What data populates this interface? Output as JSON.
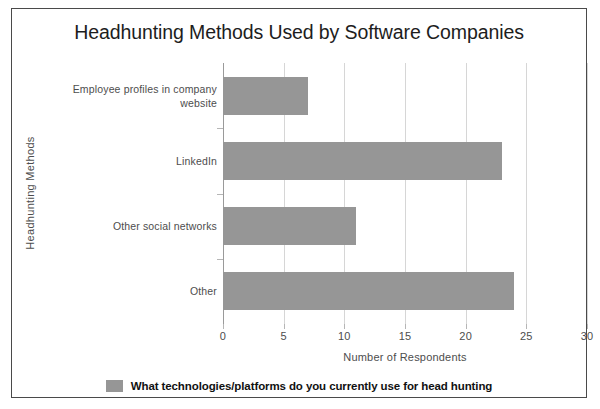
{
  "chart_data": {
    "type": "bar",
    "orientation": "horizontal",
    "title": "Headhunting Methods Used by Software Companies",
    "xlabel": "Number of Respondents",
    "ylabel": "Headhunting Methods",
    "categories": [
      "Employee profiles in company website",
      "LinkedIn",
      "Other social networks",
      "Other"
    ],
    "category_lines": [
      [
        "Employee profiles in company",
        "website"
      ],
      [
        "LinkedIn"
      ],
      [
        "Other social networks"
      ],
      [
        "Other"
      ]
    ],
    "values": [
      7,
      23,
      11,
      24
    ],
    "series": [
      {
        "name": "What technologies/platforms do you currently use for head hunting",
        "values": [
          7,
          23,
          11,
          24
        ]
      }
    ],
    "xlim": [
      0,
      30
    ],
    "xticks": [
      0,
      5,
      10,
      15,
      20,
      25,
      30
    ],
    "xtick_labels": [
      "0",
      "5",
      "10",
      "15",
      "20",
      "25",
      "30"
    ],
    "grid": true,
    "grid_axis": "x",
    "legend_position": "bottom",
    "legend": [
      {
        "label": "What technologies/platforms do you currently use for head hunting",
        "color": "#969696"
      }
    ],
    "colors": {
      "bar": "#969696",
      "gridline": "#d6d6d6",
      "axis": "#9a9a9a",
      "text": "#4d4d4d",
      "title_text": "#1d1d1d",
      "frame_border": "#4a4a4a",
      "background": "#ffffff"
    }
  }
}
